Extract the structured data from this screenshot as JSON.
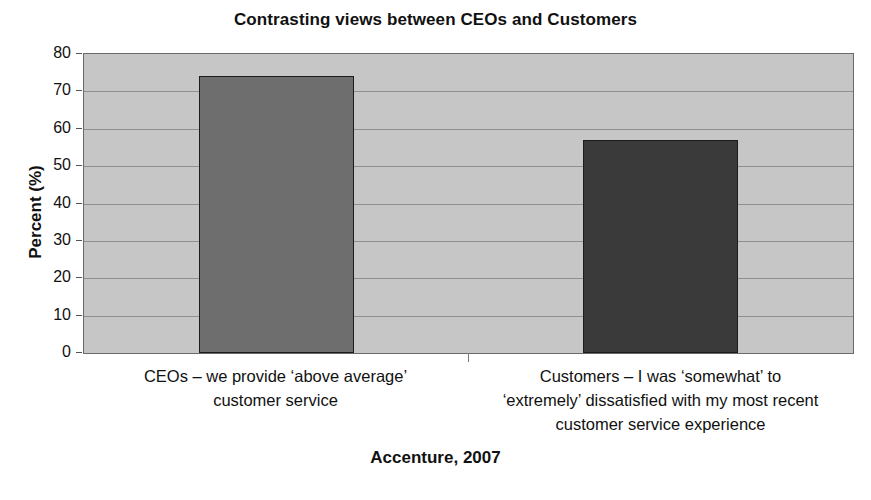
{
  "chart_data": {
    "type": "bar",
    "title": "Contrasting views between CEOs and Customers",
    "xlabel": "Accenture, 2007",
    "ylabel": "Percent (%)",
    "ylim": [
      0,
      80
    ],
    "ytick_labels": [
      "0",
      "10",
      "20",
      "30",
      "40",
      "50",
      "60",
      "70",
      "80"
    ],
    "ytick_values": [
      0,
      10,
      20,
      30,
      40,
      50,
      60,
      70,
      80
    ],
    "grid": true,
    "legend": "none",
    "categories": [
      "CEOs – we provide ‘above average’ customer service",
      "Customers – I was ‘somewhat’ to ‘extremely’ dissatisfied with my most recent customer service experience"
    ],
    "category_lines": [
      [
        "CEOs – we provide ‘above average’",
        "customer service"
      ],
      [
        "Customers – I was ‘somewhat’ to",
        "‘extremely’ dissatisfied with my most recent",
        "customer service experience"
      ]
    ],
    "values": [
      74,
      57
    ],
    "bar_colors": [
      "#6e6e6e",
      "#3a3a3a"
    ],
    "plot_background": "#c6c6c6",
    "gridline_color": "#8f8f8f",
    "axis_color": "#6a6a6a",
    "text_color": "#111111"
  }
}
